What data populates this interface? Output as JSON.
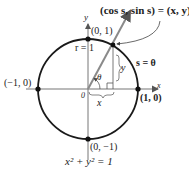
{
  "diagram": {
    "labels": {
      "point_top": "(0, 1)",
      "point_left": "(−1, 0)",
      "point_right": "(1, 0)",
      "point_bottom": "(0, −1)",
      "origin": "0",
      "x_axis": "x",
      "y_axis": "y",
      "radius": "r = 1",
      "arc": "s = θ",
      "angle": "θ",
      "leg_x": "x",
      "leg_y": "y",
      "callout": "(cos s, sin s) = (x, y)",
      "equation": "x² + y² = 1"
    },
    "colors": {
      "circle": "#1a1a1a",
      "axes": "#777777",
      "ray": "#8a8a8a",
      "text": "#222222"
    }
  }
}
